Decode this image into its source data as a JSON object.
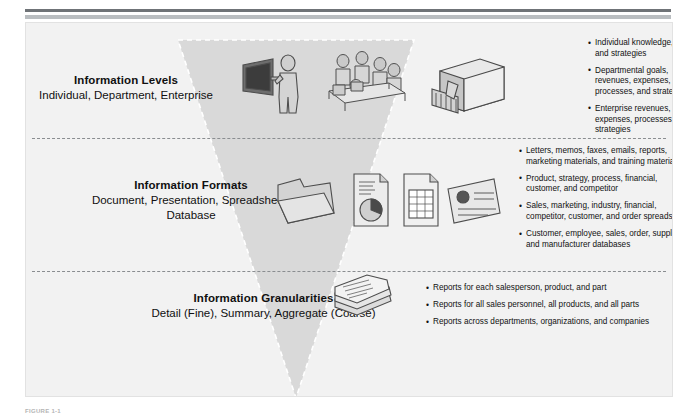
{
  "figure": {
    "caption": "FIGURE 1-1",
    "rule_dark_color": "#6f7377",
    "rule_light_color": "#b9bdc0",
    "panel_bg": "#f2f2f2",
    "triangle_fill": "#d8d8d8"
  },
  "sections": [
    {
      "id": "levels",
      "title": "Information Levels",
      "subtitle": "Individual, Department, Enterprise",
      "icons": [
        {
          "name": "person-at-monitor-icon",
          "label": "Individual"
        },
        {
          "name": "meeting-table-people-icon",
          "label": "Department"
        },
        {
          "name": "enterprise-building-icon",
          "label": "Enterprise"
        }
      ],
      "bullets": [
        "Individual knowledge, goals, and strategies",
        "Departmental goals, revenues, expenses, processes, and strategies",
        "Enterprise revenues, expenses, processes, and strategies"
      ]
    },
    {
      "id": "formats",
      "title": "Information Formats",
      "subtitle": "Document, Presentation, Spreadsheet, Database",
      "icons": [
        {
          "name": "document-folder-icon",
          "label": "Document"
        },
        {
          "name": "presentation-piechart-icon",
          "label": "Presentation"
        },
        {
          "name": "spreadsheet-grid-icon",
          "label": "Spreadsheet"
        },
        {
          "name": "database-card-icon",
          "label": "Database"
        }
      ],
      "bullets": [
        "Letters, memos, faxes, emails, reports, marketing materials, and training materials",
        "Product, strategy, process, financial, customer, and competitor",
        "Sales, marketing, industry, financial, competitor, customer, and order spreadsheets",
        "Customer, employee, sales, order, supplier, and manufacturer databases"
      ]
    },
    {
      "id": "granularities",
      "title": "Information Granularities",
      "subtitle": "Detail (Fine), Summary, Aggregate (Coarse)",
      "icons": [
        {
          "name": "stacked-reports-icon",
          "label": "Reports"
        }
      ],
      "bullets": [
        "Reports for each salesperson, product, and part",
        "Reports for all sales personnel, all products, and all parts",
        "Reports across departments, organizations, and companies"
      ]
    }
  ]
}
